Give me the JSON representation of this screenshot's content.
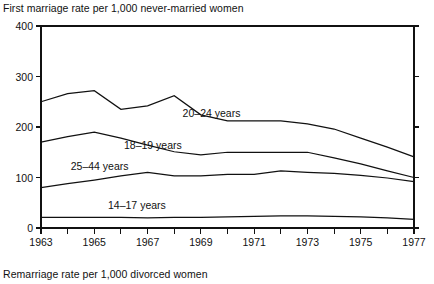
{
  "figure": {
    "title_top": "First marriage rate per 1,000 never-married women",
    "title_bottom": "Remarriage rate per 1,000 divorced women"
  },
  "chart_data": {
    "type": "line",
    "title": "First marriage rate per 1,000 never-married women",
    "subtitle": "Remarriage rate per 1,000 divorced women",
    "xlabel": "",
    "ylabel": "",
    "xlim": [
      1963,
      1977
    ],
    "ylim": [
      0,
      400
    ],
    "yticks": [
      0,
      100,
      200,
      300,
      400
    ],
    "ytick_labels": [
      "0",
      "100",
      "200",
      "300",
      "400"
    ],
    "x": [
      1963,
      1964,
      1965,
      1966,
      1967,
      1968,
      1969,
      1970,
      1971,
      1972,
      1973,
      1974,
      1975,
      1976,
      1977
    ],
    "xticks": [
      1963,
      1964,
      1965,
      1966,
      1967,
      1968,
      1969,
      1970,
      1971,
      1972,
      1973,
      1974,
      1975,
      1976,
      1977
    ],
    "xtick_labels": [
      "1963",
      "",
      "1965",
      "",
      "1967",
      "",
      "1969",
      "",
      "1971",
      "",
      "1973",
      "",
      "1975",
      "",
      "1977"
    ],
    "grid": false,
    "legend_position": "inline-annotations",
    "series": [
      {
        "name": "20-24 years",
        "label": "20–24 years",
        "label_x": 1969.4,
        "label_y": 228,
        "color": "#111111",
        "values": [
          250,
          266,
          272,
          235,
          242,
          262,
          224,
          212,
          212,
          212,
          206,
          196,
          178,
          160,
          141
        ]
      },
      {
        "name": "18-19 years",
        "label": "18–19 years",
        "label_x": 1967.2,
        "label_y": 165,
        "color": "#111111",
        "values": [
          170,
          181,
          190,
          178,
          164,
          151,
          145,
          150,
          150,
          150,
          150,
          139,
          127,
          113,
          100
        ]
      },
      {
        "name": "25-44 years",
        "label": "25–44 years",
        "label_x": 1965.2,
        "label_y": 122,
        "color": "#111111",
        "values": [
          80,
          88,
          95,
          103,
          110,
          103,
          103,
          106,
          106,
          113,
          110,
          108,
          104,
          99,
          92
        ]
      },
      {
        "name": "14-17 years",
        "label": "14–17 years",
        "label_x": 1966.6,
        "label_y": 45,
        "color": "#111111",
        "values": [
          21,
          21,
          21,
          21,
          20,
          21,
          21,
          22,
          23,
          24,
          24,
          23,
          22,
          20,
          17
        ]
      }
    ]
  },
  "plot_geometry": {
    "left": 41,
    "right": 414,
    "top": 26,
    "bottom": 228
  }
}
